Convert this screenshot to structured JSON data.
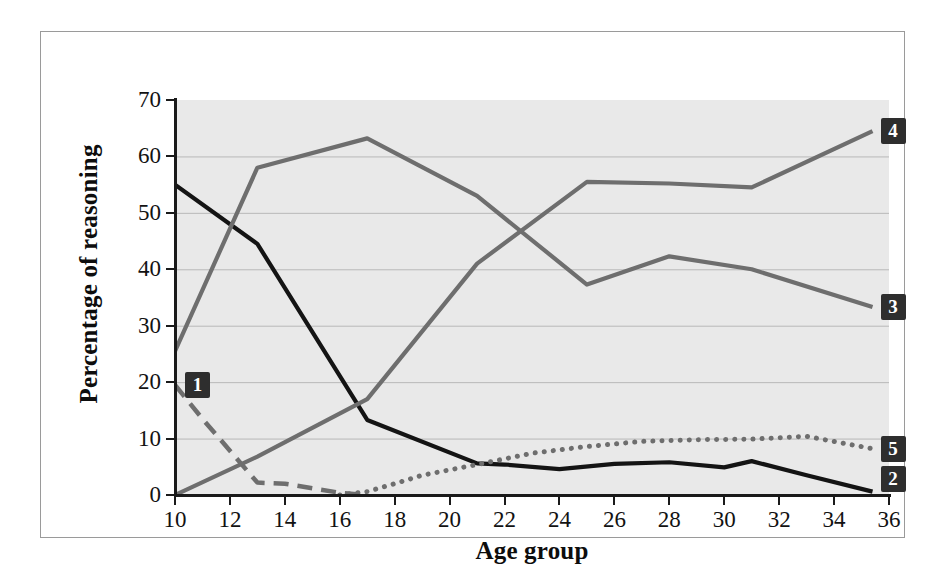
{
  "chart_data": {
    "type": "line",
    "title": "",
    "xlabel": "Age group",
    "ylabel": "Percentage of reasoning",
    "xlim": [
      10,
      36
    ],
    "ylim": [
      0,
      70
    ],
    "xticks": [
      10,
      12,
      14,
      16,
      18,
      20,
      22,
      24,
      26,
      28,
      30,
      32,
      34,
      36
    ],
    "yticks": [
      0,
      10,
      20,
      30,
      40,
      50,
      60,
      70
    ],
    "grid": "horizontal",
    "legend_position": "line-end-labels",
    "series": [
      {
        "name": "1",
        "label": "1",
        "style": "dashed",
        "color": "#6e6e6e",
        "x": [
          10,
          11,
          13,
          14,
          15,
          16,
          17
        ],
        "values": [
          19.5,
          13.5,
          2.2,
          2.0,
          1.2,
          0.4,
          0.0
        ]
      },
      {
        "name": "2",
        "label": "2",
        "style": "solid",
        "color": "#141414",
        "x": [
          10,
          13,
          17,
          21,
          22,
          24,
          26,
          28,
          30,
          31,
          33,
          35.4
        ],
        "values": [
          55.0,
          44.5,
          13.3,
          5.6,
          5.4,
          4.6,
          5.5,
          5.8,
          4.9,
          6.0,
          3.5,
          0.6
        ]
      },
      {
        "name": "3",
        "label": "3",
        "style": "solid",
        "color": "#6e6e6e",
        "x": [
          10,
          13,
          17,
          21,
          25,
          28,
          31,
          35.4
        ],
        "values": [
          25.5,
          58.0,
          63.2,
          53.0,
          37.3,
          42.3,
          40.0,
          33.3
        ]
      },
      {
        "name": "4",
        "label": "4",
        "style": "solid",
        "color": "#6e6e6e",
        "x": [
          10,
          13,
          17,
          21,
          25,
          28,
          31,
          35.4
        ],
        "values": [
          0.0,
          6.8,
          17.0,
          41.0,
          55.5,
          55.2,
          54.5,
          64.5
        ]
      },
      {
        "name": "5",
        "label": "5",
        "style": "dotted",
        "color": "#6e6e6e",
        "x": [
          16,
          17,
          18,
          19,
          21,
          23,
          25,
          27,
          29,
          31,
          33,
          35.4
        ],
        "values": [
          0.0,
          0.6,
          2.0,
          3.5,
          5.4,
          7.4,
          8.6,
          9.5,
          9.8,
          9.9,
          10.4,
          8.2
        ]
      }
    ]
  },
  "axes": {
    "y_title": "Percentage of reasoning",
    "x_title": "Age group",
    "y_tick_labels": [
      "70",
      "60",
      "50",
      "40",
      "30",
      "20",
      "10",
      "0"
    ],
    "x_tick_labels": [
      "10",
      "12",
      "14",
      "16",
      "18",
      "20",
      "22",
      "24",
      "26",
      "28",
      "30",
      "32",
      "34",
      "36"
    ]
  },
  "labels": {
    "s1": "1",
    "s2": "2",
    "s3": "3",
    "s4": "4",
    "s5": "5"
  },
  "colors": {
    "plot_background": "#e9e9e9",
    "page_background": "#ffffff",
    "frame_border": "#9a9a9a",
    "axis": "#1a1a1a",
    "gridline": "#b9b9b9",
    "series_gray": "#6e6e6e",
    "series_black": "#141414",
    "label_badge": "#2e2e2e"
  }
}
